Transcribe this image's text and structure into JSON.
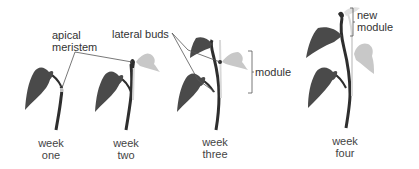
{
  "diagram": {
    "type": "plant-growth-sequence",
    "colors": {
      "dark_leaf": "#4a4a4a",
      "light_leaf": "#c8c8c8",
      "stem": "#2e2e2e",
      "pale_stem": "#d9d9d9",
      "line": "#555555",
      "text": "#333333"
    },
    "annotations": {
      "apical_meristem_line1": "apical",
      "apical_meristem_line2": "meristem",
      "lateral_buds": "lateral buds",
      "module": "module",
      "new_module_line1": "new",
      "new_module_line2": "module"
    },
    "stages": [
      {
        "line1": "week",
        "line2": "one"
      },
      {
        "line1": "week",
        "line2": "two"
      },
      {
        "line1": "week",
        "line2": "three"
      },
      {
        "line1": "week",
        "line2": "four"
      }
    ]
  }
}
